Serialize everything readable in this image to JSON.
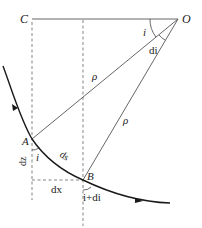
{
  "diagram": {
    "points": {
      "C": "C",
      "O": "O",
      "A": "A",
      "B": "B"
    },
    "labels": {
      "angle_i_top": "i",
      "angle_di": "di",
      "rho_OA": "ρ",
      "rho_OB": "ρ",
      "dz": "dz",
      "angle_i_A": "i",
      "ds": "ds",
      "dx": "dx",
      "angle_i_plus_di": "i+di"
    },
    "colors": {
      "line": "#555555",
      "curve": "#1a1a1a",
      "dash": "#777777"
    }
  }
}
